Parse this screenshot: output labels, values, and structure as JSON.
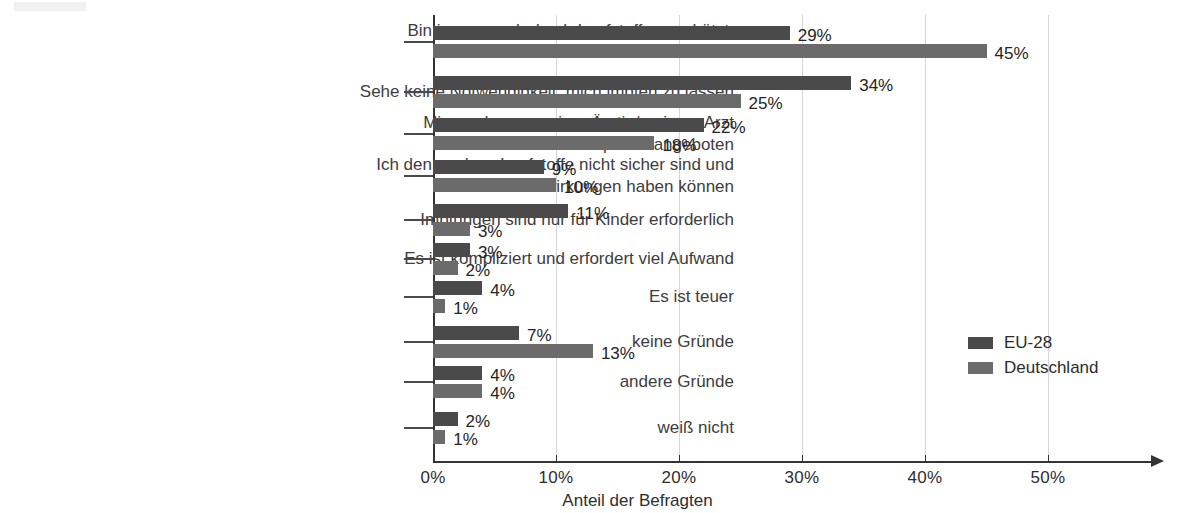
{
  "chart_data": {
    "type": "bar",
    "orientation": "horizontal",
    "grouped": true,
    "title": "",
    "xlabel": "Anteil der Befragten",
    "ylabel": "",
    "xlim": [
      0,
      54
    ],
    "xticks": [
      "0%",
      "10%",
      "20%",
      "30%",
      "40%",
      "50%"
    ],
    "xtick_values": [
      0,
      10,
      20,
      30,
      40,
      50
    ],
    "grid": "vertical",
    "legend_position": "right-middle",
    "categories": [
      "Bin immer noch durch Impfstoffe geschützt,\ndie ich zuvor erhalten habe",
      "Sehe keine Notwendigkeit, mich impfen zu lassen",
      "Mir wurde von meiner Ärztin/meinem Arzt\nkein Impfstoff angeboten",
      "Ich denke, dass Impfstoffe nicht sicher sind und\nNebenwirkungen haben können",
      "Impfungen sind nur für Kinder erforderlich",
      "Es ist kompliziert und erfordert viel Aufwand",
      "Es ist teuer",
      "keine Gründe",
      "andere Gründe",
      "weiß nicht"
    ],
    "series": [
      {
        "name": "EU-28",
        "color": "#4a4a4a",
        "values": [
          29,
          34,
          22,
          9,
          11,
          3,
          4,
          7,
          4,
          2
        ],
        "labels": [
          "29%",
          "34%",
          "22%",
          "9%",
          "11%",
          "3%",
          "4%",
          "7%",
          "4%",
          "2%"
        ]
      },
      {
        "name": "Deutschland",
        "color": "#6b6b6b",
        "values": [
          45,
          25,
          18,
          10,
          3,
          2,
          1,
          13,
          4,
          1
        ],
        "labels": [
          "45%",
          "25%",
          "18%",
          "10%",
          "3%",
          "2%",
          "1%",
          "13%",
          "4%",
          "1%"
        ]
      }
    ]
  },
  "legend": {
    "entries": [
      {
        "label": "EU-28",
        "color": "#4a4a4a"
      },
      {
        "label": "Deutschland",
        "color": "#6b6b6b"
      }
    ]
  }
}
